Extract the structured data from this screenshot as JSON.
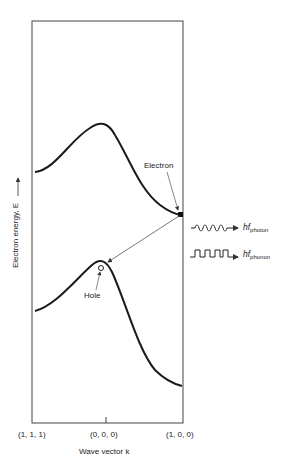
{
  "figure": {
    "y_axis_label": "Electron energy, E",
    "x_axis_label": "Wave vector k",
    "x_ticks": [
      "(1, 1, 1)",
      "(0, 0, 0)",
      "(1, 0, 0)"
    ],
    "annotations": {
      "electron": "Electron",
      "hole": "Hole"
    },
    "emissions": {
      "photon_prefix": "hf",
      "photon_sub": "photon",
      "phonon_prefix": "hf",
      "phonon_sub": "phonon"
    },
    "colors": {
      "line": "#1a1a1a",
      "arrow": "#555555",
      "background": "#ffffff"
    }
  }
}
